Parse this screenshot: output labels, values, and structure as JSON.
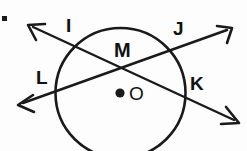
{
  "figure": {
    "kind": "geometry-diagram",
    "background_color": "#fdfdfd",
    "stroke_color": "#1a1a1a",
    "width": 247,
    "height": 151
  },
  "labels": {
    "point_i": "I",
    "point_j": "J",
    "point_k": "K",
    "point_l": "L",
    "point_m": "M",
    "point_o": "O"
  },
  "geometry": {
    "circle": {
      "center_x": 120.5,
      "center_y": 93,
      "radius": 65,
      "stroke_width": 2.6
    },
    "center_dot": {
      "cx": 120,
      "cy": 93,
      "r": 4.6
    },
    "intersection_point": {
      "name": "M",
      "x": 124,
      "y": 62
    },
    "secant_ik": {
      "name": "line-IK",
      "x1": 28,
      "y1": 25,
      "x2": 239,
      "y2": 123,
      "stroke_width": 2.4,
      "arrow_start": true,
      "arrow_end": true
    },
    "secant_jl": {
      "name": "line-JL",
      "x1": 232,
      "y1": 28,
      "x2": 18,
      "y2": 105,
      "stroke_width": 2.4,
      "arrow_start": true,
      "arrow_end": true
    }
  }
}
